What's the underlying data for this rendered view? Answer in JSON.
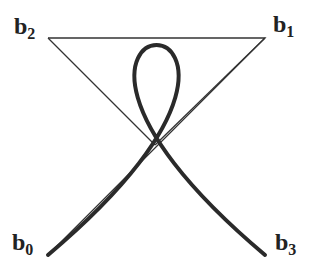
{
  "diagram": {
    "type": "cubic-bezier-loop",
    "labels": {
      "b0": {
        "base": "b",
        "sub": "0"
      },
      "b1": {
        "base": "b",
        "sub": "1"
      },
      "b2": {
        "base": "b",
        "sub": "2"
      },
      "b3": {
        "base": "b",
        "sub": "3"
      }
    },
    "colors": {
      "curve": "#2a2a2a",
      "polygon": "#333333",
      "label": "#222222"
    }
  }
}
